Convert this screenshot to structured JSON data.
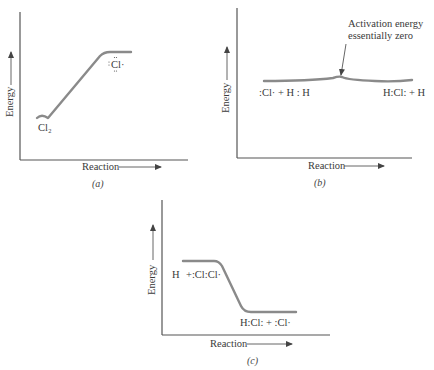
{
  "figure": {
    "panels": [
      {
        "id": "a",
        "caption": "(a)",
        "y_axis_label": "Energy",
        "x_axis_label": "Reaction",
        "species_labels": {
          "start": "Cl₂",
          "end": "Cl·"
        },
        "profile": "uphill (endothermic)"
      },
      {
        "id": "b",
        "caption": "(b)",
        "y_axis_label": "Energy",
        "x_axis_label": "Reaction",
        "species_labels": {
          "start": ":Cl· + H : H",
          "end": "H:Cl: + H"
        },
        "annotation_line1": "Activation energy",
        "annotation_line2": "essentially zero",
        "profile": "flat with small bump"
      },
      {
        "id": "c",
        "caption": "(c)",
        "y_axis_label": "Energy",
        "x_axis_label": "Reaction",
        "species_labels": {
          "start_h": "H",
          "start_rest": "+:Cl:Cl·",
          "end": "H:Cl: + :Cl·"
        },
        "profile": "downhill (exothermic)"
      }
    ],
    "colors": {
      "curve": "#8a8a8a",
      "axis": "#555555",
      "text": "#3a3a3a"
    }
  }
}
